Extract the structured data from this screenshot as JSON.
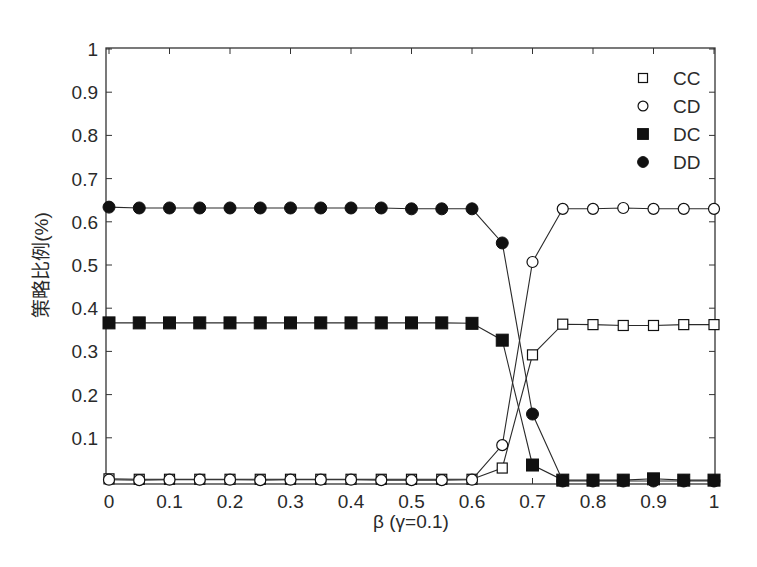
{
  "chart_data": {
    "type": "line",
    "title": "",
    "xlabel": "β (γ=0.1)",
    "ylabel": "策略比例(%)",
    "xlim": [
      0,
      1
    ],
    "ylim": [
      0,
      1
    ],
    "grid": false,
    "legend_position": "upper right (inside)",
    "x_ticks": [
      "0",
      "0.1",
      "0.2",
      "0.3",
      "0.4",
      "0.5",
      "0.6",
      "0.7",
      "0.8",
      "0.9",
      "1"
    ],
    "y_ticks": [
      "0.1",
      "0.2",
      "0.3",
      "0.4",
      "0.5",
      "0.6",
      "0.7",
      "0.8",
      "0.9",
      "1"
    ],
    "x": [
      0,
      0.05,
      0.1,
      0.15,
      0.2,
      0.25,
      0.3,
      0.35,
      0.4,
      0.45,
      0.5,
      0.55,
      0.6,
      0.65,
      0.7,
      0.75,
      0.8,
      0.85,
      0.9,
      0.95,
      1.0
    ],
    "series": [
      {
        "name": "CC",
        "marker": "square-open",
        "values": [
          0.005,
          0.004,
          0.004,
          0.004,
          0.004,
          0.004,
          0.004,
          0.004,
          0.004,
          0.004,
          0.004,
          0.004,
          0.004,
          0.03,
          0.292,
          0.363,
          0.362,
          0.36,
          0.36,
          0.362,
          0.362
        ]
      },
      {
        "name": "CD",
        "marker": "circle-open",
        "values": [
          0.003,
          0.002,
          0.003,
          0.003,
          0.003,
          0.002,
          0.003,
          0.003,
          0.003,
          0.002,
          0.002,
          0.002,
          0.003,
          0.083,
          0.507,
          0.63,
          0.63,
          0.632,
          0.63,
          0.63,
          0.63
        ]
      },
      {
        "name": "DC",
        "marker": "square-filled",
        "values": [
          0.366,
          0.366,
          0.366,
          0.366,
          0.366,
          0.366,
          0.366,
          0.366,
          0.366,
          0.366,
          0.366,
          0.366,
          0.365,
          0.326,
          0.037,
          0.002,
          0.002,
          0.002,
          0.005,
          0.002,
          0.002
        ]
      },
      {
        "name": "DD",
        "marker": "circle-filled",
        "values": [
          0.634,
          0.632,
          0.632,
          0.632,
          0.632,
          0.632,
          0.632,
          0.632,
          0.632,
          0.632,
          0.63,
          0.63,
          0.63,
          0.551,
          0.155,
          0.0,
          0.0,
          0.0,
          0.0,
          0.0,
          0.0
        ]
      }
    ]
  },
  "legend": {
    "items": [
      {
        "label": "CC",
        "marker": "square-open"
      },
      {
        "label": "CD",
        "marker": "circle-open"
      },
      {
        "label": "DC",
        "marker": "square-filled"
      },
      {
        "label": "DD",
        "marker": "circle-filled"
      }
    ]
  },
  "colors": {
    "line": "#2a2a2a",
    "marker": "#111111",
    "frame": "#333333"
  }
}
